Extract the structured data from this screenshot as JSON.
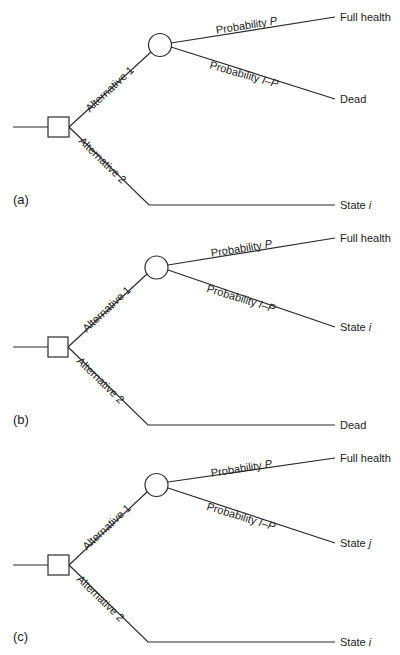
{
  "colors": {
    "line": "#2b2b2b",
    "text": "#222222",
    "background": "#ffffff"
  },
  "labels": {
    "alternative_1": "Alternative 1",
    "alternative_2": "Alternative 2",
    "probability_p_prefix": "Probability ",
    "probability_p_var": "P",
    "probability_q_prefix": "Probability ",
    "probability_q_var": "I–P"
  },
  "panels": [
    {
      "id": "a",
      "tag": "(a)",
      "outcome_top": "Full health",
      "outcome_mid_prefix": "Dead",
      "outcome_mid_var": "",
      "outcome_bottom_prefix": "State ",
      "outcome_bottom_var": "i"
    },
    {
      "id": "b",
      "tag": "(b)",
      "outcome_top": "Full health",
      "outcome_mid_prefix": "State ",
      "outcome_mid_var": "i",
      "outcome_bottom_prefix": "Dead",
      "outcome_bottom_var": ""
    },
    {
      "id": "c",
      "tag": "(c)",
      "outcome_top": "Full health",
      "outcome_mid_prefix": "State ",
      "outcome_mid_var": "j",
      "outcome_bottom_prefix": "State ",
      "outcome_bottom_var": "i"
    }
  ]
}
